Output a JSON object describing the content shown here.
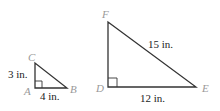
{
  "small_triangle": {
    "vertices": {
      "A": "A",
      "B": "B",
      "C": "C"
    },
    "side_labels": {
      "AC": "3 in.",
      "AB": "4 in."
    },
    "right_angle_at": "A"
  },
  "large_triangle": {
    "vertices": {
      "D": "D",
      "E": "E",
      "F": "F"
    },
    "side_labels": {
      "EF": "15 in.",
      "DE": "12 in."
    },
    "right_angle_at": "D"
  },
  "colors": {
    "stroke": "#333333",
    "vertex_label": "#999999",
    "text": "#222222"
  }
}
